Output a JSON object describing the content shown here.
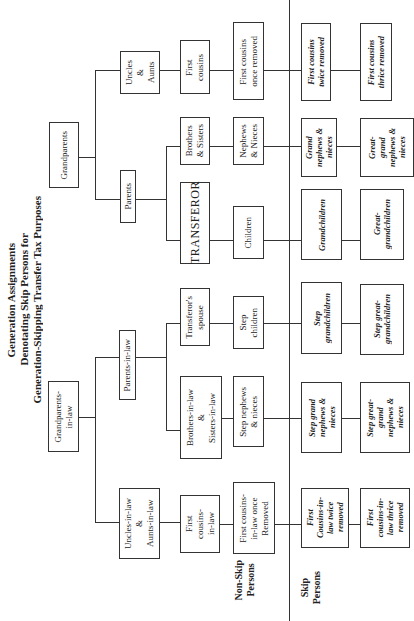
{
  "title": "Generation Assignments\nDenotating Skip Persons for\nGeneration-Skipping Transfer Tax Purposes",
  "sections": {
    "non_skip": "Non-Skip\nPersons",
    "skip": "Skip\nPersons"
  },
  "blood_side": {
    "grandparents": "Grandparents",
    "parents": "Parents",
    "uncles_aunts": "Uncles\n&\nAunts",
    "transferor": "TRANSFEROR",
    "brothers_sisters": "Brothers\n& Sisters",
    "first_cousins": "First\ncousins",
    "children": "Children",
    "nephews_nieces": "Nephews\n& Nieces",
    "first_cousins_once": "First cousins\nonce removed",
    "grandchildren": "Grandchildren",
    "grand_nephews": "Grand\nnephews &\nnieces",
    "first_cousins_twice": "First cousins\ntwice removed",
    "great_grandchildren": "Great-\ngrandchildren",
    "great_grand_nephews": "Great-\ngrand\nnephews &\nnieces",
    "first_cousins_thrice": "First cousins\nthrice removed"
  },
  "inlaw_side": {
    "grandparents_in_law": "Grandparents-\nin-law",
    "parents_in_law": "Parents-in-law",
    "uncles_in_law": "Uncles-in-law\n&\nAunts-in-law",
    "spouse": "Transferor's\nspouse",
    "brothers_in_law": "Brothers-in-law\n&\nSisters-in-law",
    "first_cousins_in_law": "First\ncousins-\nin-law",
    "step_children": "Step\nchildren",
    "step_nephews": "Step nephews\n& nieces",
    "first_cousins_in_law_once": "First cousins-\nin-law once\nRemoved",
    "step_grandchildren": "Step\ngrandchildren",
    "step_grand_nephews": "Step grand\nnephews &\nnieces",
    "first_cousins_in_law_twice": "First\nCousins-in-\nlaw twice\nremoved",
    "step_great_grandchildren": "Step great-\ngrandchildren",
    "step_great_grand_nephews": "Step great-\ngrand\nnephews &\nnieces",
    "first_cousins_in_law_thrice": "First\ncousins-in-\nlaw thrice\nremoved"
  }
}
